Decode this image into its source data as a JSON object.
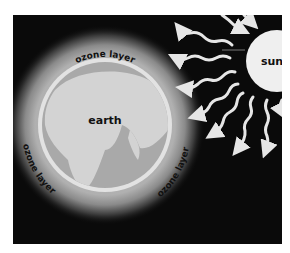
{
  "diagram": {
    "labels": {
      "sun": "sun",
      "earth": "earth",
      "ozone_top": "ozone layer",
      "ozone_left": "ozone layer",
      "ozone_right": "ozone layer"
    },
    "colors": {
      "background": "#0a0a0a",
      "page": "#ffffff",
      "sun": "#efefef",
      "earth_land": "#d0d0d0",
      "earth_water": "#a9a9a9",
      "earth_rim": "#e2e2e2",
      "ozone_glow": "#b5b5b5",
      "rays": "#e6e6e6",
      "text": "#111111"
    }
  }
}
